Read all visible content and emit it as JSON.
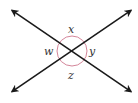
{
  "diagram": {
    "intersection": {
      "x": 72,
      "y": 51
    },
    "angle_circle": {
      "radius": 15,
      "color": "#d4869a"
    },
    "line_color": "#1a1a1a",
    "lines": [
      {
        "name": "line-nw-se",
        "x1": 10,
        "y1": 9,
        "x2": 133,
        "y2": 93
      },
      {
        "name": "line-sw-ne",
        "x1": 10,
        "y1": 93,
        "x2": 133,
        "y2": 9
      }
    ],
    "labels": {
      "top": "x",
      "left": "w",
      "right": "y",
      "bottom": "z"
    }
  }
}
